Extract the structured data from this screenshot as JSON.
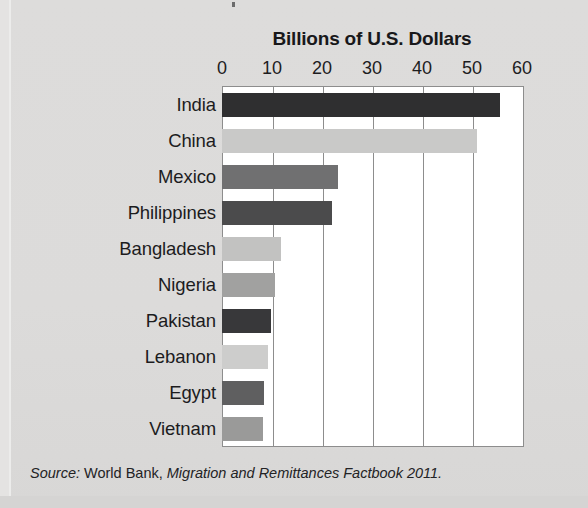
{
  "figure": {
    "background_color": "#dcdcdb",
    "plot_background_color": "#ffffff",
    "frame_color": "#8d8d8d"
  },
  "source_note": {
    "label": "Source:",
    "organization": " World Bank,",
    "title": " Migration and Remittances Factbook 2011."
  },
  "chart_data": {
    "type": "bar",
    "orientation": "horizontal",
    "title": "Billions of U.S. Dollars",
    "xlabel": "",
    "ylabel": "",
    "xlim": [
      0,
      60
    ],
    "ylim": [
      0,
      10
    ],
    "xticks": [
      0,
      10,
      20,
      30,
      40,
      50,
      60
    ],
    "xtick_labels": [
      "0",
      "10",
      "20",
      "30",
      "40",
      "50",
      "60"
    ],
    "grid": true,
    "grid_axis": "x",
    "legend": false,
    "categories": [
      "India",
      "China",
      "Mexico",
      "Philippines",
      "Bangladesh",
      "Nigeria",
      "Pakistan",
      "Lebanon",
      "Egypt",
      "Vietnam"
    ],
    "values": [
      55.5,
      51.0,
      23.2,
      21.9,
      11.8,
      10.6,
      9.8,
      9.2,
      8.4,
      8.2
    ],
    "bar_colors": [
      "#2f2f30",
      "#c9c9c8",
      "#707071",
      "#4b4b4c",
      "#c2c2c1",
      "#a1a1a0",
      "#38383a",
      "#cdcdcc",
      "#5f5f60",
      "#9a9a99"
    ]
  }
}
